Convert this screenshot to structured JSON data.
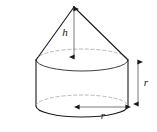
{
  "figure": {
    "name": "cone-on-cylinder-diagram",
    "type": "geometric-solid-diagram",
    "background_color": "#ffffff",
    "stroke_color": "#1a1a1a",
    "hidden_edge_color": "#9a9a9a",
    "labels": {
      "cone_height": "h",
      "cylinder_height": "r",
      "base_radius": "r"
    },
    "geometry": {
      "apex": {
        "x": 74,
        "y": 7
      },
      "top_ellipse": {
        "cx": 82,
        "cy": 60,
        "rx": 46,
        "ry": 11
      },
      "bottom_ellipse": {
        "cx": 82,
        "cy": 106,
        "rx": 46,
        "ry": 11
      },
      "cylinder_left_wall_x": 36,
      "cylinder_right_wall_x": 128,
      "cylinder_top_y": 60,
      "cylinder_bottom_y": 106
    },
    "dimension_arrows": {
      "height_arrow": {
        "orientation": "vertical",
        "x": 74,
        "y1": 8,
        "y2": 59,
        "label": "h"
      },
      "side_arrow": {
        "orientation": "vertical",
        "x": 138,
        "y1": 60,
        "y2": 106,
        "label": "r"
      },
      "radius_arrow": {
        "orientation": "horizontal",
        "y": 107,
        "x1": 77,
        "x2": 127,
        "label": "r"
      }
    },
    "label_positions": {
      "h": {
        "x": 65,
        "y": 36
      },
      "r_side": {
        "x": 143,
        "y": 86
      },
      "r_radius": {
        "x": 100,
        "y": 119
      }
    }
  }
}
